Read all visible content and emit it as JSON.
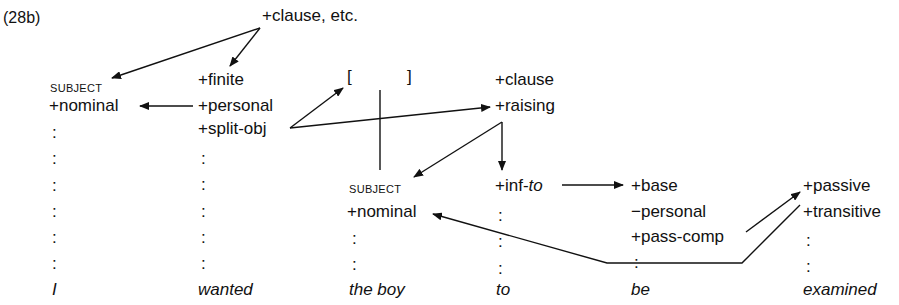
{
  "label": "(28b)",
  "root": "+clause, etc.",
  "columns": [
    {
      "word": "I",
      "features": [
        "SUBJECT",
        "+nominal"
      ]
    },
    {
      "word": "wanted",
      "features": [
        "+finite",
        "+personal",
        "+split-obj"
      ]
    },
    {
      "word": "the boy",
      "bracket_open": "[",
      "bracket_close": "]",
      "features": [
        "SUBJECT",
        "+nominal"
      ]
    },
    {
      "word": "to",
      "features": [
        "+clause",
        "+raising",
        "+inf-",
        "to"
      ]
    },
    {
      "word": "be",
      "features": [
        "+base",
        "−personal",
        "+pass-comp"
      ]
    },
    {
      "word": "examined",
      "features": [
        "+passive",
        "+transitive"
      ]
    }
  ],
  "colors": {
    "ink": "#111111",
    "background": "#ffffff"
  }
}
